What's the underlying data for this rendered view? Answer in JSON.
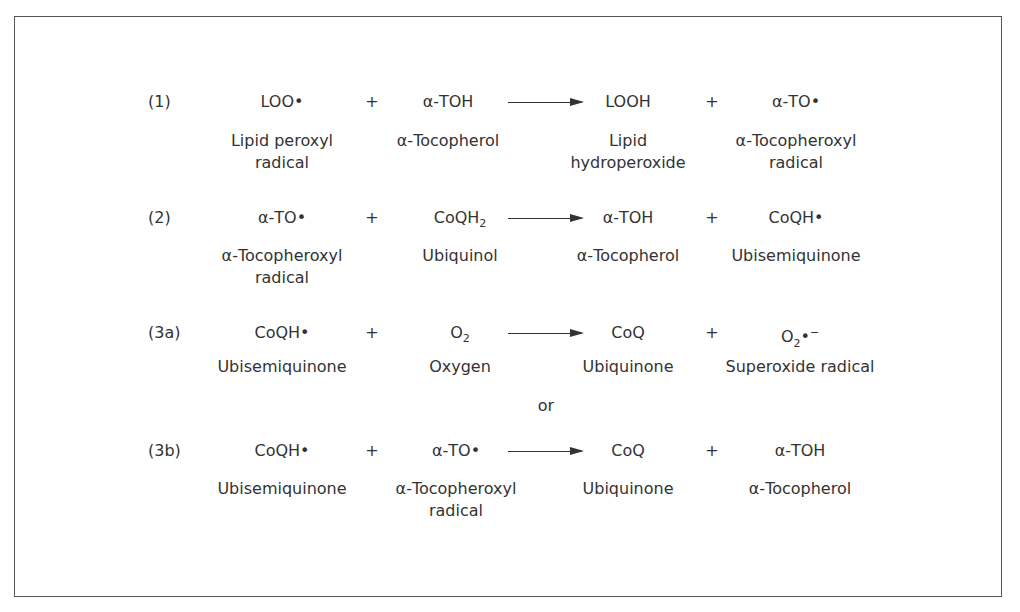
{
  "reactions": [
    {
      "label": "(1)",
      "reactant1": {
        "formula": "LOO•",
        "name": "Lipid peroxyl\nradical"
      },
      "plus1": "+",
      "reactant2": {
        "formula": "α-TOH",
        "name": "α-Tocopherol"
      },
      "product1": {
        "formula": "LOOH",
        "name": "Lipid\nhydroperoxide"
      },
      "plus2": "+",
      "product2": {
        "formula": "α-TO•",
        "name": "α-Tocopheroxyl\nradical"
      }
    },
    {
      "label": "(2)",
      "reactant1": {
        "formula": "α-TO•",
        "name": "α-Tocopheroxyl\nradical"
      },
      "plus1": "+",
      "reactant2": {
        "formula_base": "CoQH",
        "formula_sub": "2",
        "name": "Ubiquinol"
      },
      "product1": {
        "formula": "α-TOH",
        "name": "α-Tocopherol"
      },
      "plus2": "+",
      "product2": {
        "formula": "CoQH•",
        "name": "Ubisemiquinone"
      }
    },
    {
      "label": "(3a)",
      "reactant1": {
        "formula": "CoQH•",
        "name": "Ubisemiquinone"
      },
      "plus1": "+",
      "reactant2": {
        "formula_base": "O",
        "formula_sub": "2",
        "name": "Oxygen"
      },
      "product1": {
        "formula": "CoQ",
        "name": "Ubiquinone"
      },
      "plus2": "+",
      "product2": {
        "formula_base": "O",
        "formula_sub": "2",
        "formula_suffix": "•",
        "formula_sup": "−",
        "name": "Superoxide radical"
      }
    },
    {
      "label": "(3b)",
      "reactant1": {
        "formula": "CoQH•",
        "name": "Ubisemiquinone"
      },
      "plus1": "+",
      "reactant2": {
        "formula": "α-TO•",
        "name": "α-Tocopheroxyl\nradical"
      },
      "product1": {
        "formula": "CoQ",
        "name": "Ubiquinone"
      },
      "plus2": "+",
      "product2": {
        "formula": "α-TOH",
        "name": "α-Tocopherol"
      }
    }
  ],
  "separator": "or"
}
